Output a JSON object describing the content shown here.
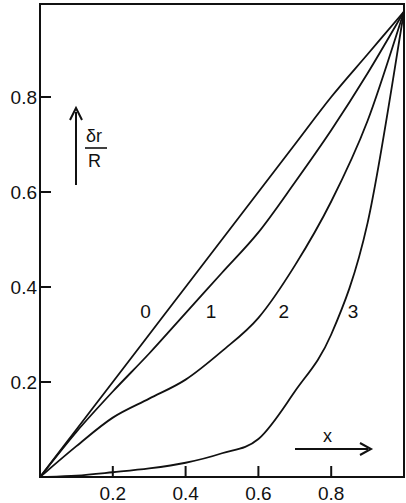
{
  "chart_data": {
    "type": "line",
    "title": "",
    "xlabel": "x",
    "ylabel": "δr/R",
    "xlim": [
      0,
      1.0
    ],
    "ylim": [
      0,
      1.0
    ],
    "grid": false,
    "legend": "inline curve labels",
    "x_ticks": [
      0.2,
      0.4,
      0.6,
      0.8
    ],
    "x_tick_labels": [
      "0.2",
      "0.4",
      "0.6",
      "0.8"
    ],
    "y_ticks": [
      0.2,
      0.4,
      0.6,
      0.8
    ],
    "y_tick_labels": [
      "0.2",
      "0.4",
      "0.6",
      "0.8"
    ],
    "x": [
      0,
      0.1,
      0.2,
      0.3,
      0.4,
      0.5,
      0.6,
      0.7,
      0.8,
      0.9,
      1.0
    ],
    "series": [
      {
        "name": "0",
        "values": [
          0,
          0.1,
          0.2,
          0.3,
          0.4,
          0.5,
          0.6,
          0.7,
          0.8,
          0.89,
          0.98
        ],
        "label_pos": [
          0.29,
          0.35
        ]
      },
      {
        "name": "1",
        "values": [
          0,
          0.095,
          0.18,
          0.26,
          0.345,
          0.43,
          0.515,
          0.62,
          0.73,
          0.85,
          0.98
        ],
        "label_pos": [
          0.47,
          0.35
        ]
      },
      {
        "name": "2",
        "values": [
          0,
          0.065,
          0.125,
          0.165,
          0.205,
          0.265,
          0.335,
          0.445,
          0.58,
          0.75,
          0.98
        ],
        "label_pos": [
          0.67,
          0.35
        ]
      },
      {
        "name": "3",
        "values": [
          0,
          0.003,
          0.01,
          0.018,
          0.03,
          0.05,
          0.08,
          0.18,
          0.3,
          0.535,
          0.98
        ],
        "label_pos": [
          0.86,
          0.35
        ]
      }
    ],
    "annotations": [
      {
        "text": "δr/R",
        "type": "y-axis arrow label"
      },
      {
        "text": "x",
        "type": "x-axis arrow label"
      }
    ]
  },
  "labels": {
    "y_num": "δr",
    "y_den": "R",
    "x_label": "x"
  }
}
